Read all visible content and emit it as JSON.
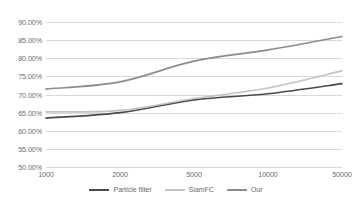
{
  "chart_data": {
    "type": "line",
    "title": "",
    "subtitle": "",
    "xlabel": "",
    "ylabel": "",
    "categories": [
      "1000",
      "2000",
      "5000",
      "10000",
      "50000"
    ],
    "series": [
      {
        "name": "Particle filter",
        "color": "#4a4a4a",
        "values": [
          63.5,
          65.0,
          68.5,
          70.2,
          73.0
        ]
      },
      {
        "name": "SiamFC",
        "color": "#c2c2c2",
        "values": [
          65.2,
          65.6,
          68.9,
          71.8,
          76.5
        ]
      },
      {
        "name": "Our",
        "color": "#8c8c8c",
        "values": [
          71.5,
          73.5,
          79.2,
          82.3,
          86.0
        ]
      }
    ],
    "ylim": [
      50,
      90
    ],
    "ytick_values": [
      50,
      55,
      60,
      65,
      70,
      75,
      80,
      85,
      90
    ],
    "ytick_labels": [
      "50.00%",
      "55.00%",
      "60.00%",
      "65.00%",
      "70.00%",
      "75.00%",
      "80.00%",
      "85.00%",
      "90.00%"
    ],
    "grid": true,
    "legend_position": "bottom",
    "axis_label_color": "#6b6b6b",
    "gridline_color": "#d9d9d9",
    "background_color": "#ffffff"
  }
}
